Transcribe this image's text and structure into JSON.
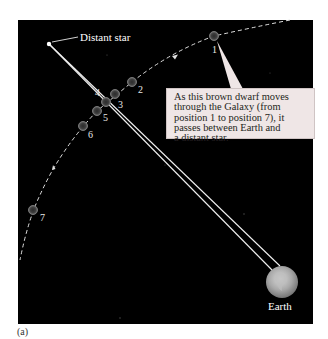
{
  "figure": {
    "panel_label": "(a)",
    "background_color": "#000000",
    "distant_star": {
      "label": "Distant star",
      "x": 49,
      "y": 44
    },
    "earth": {
      "label": "Earth",
      "x": 282,
      "y": 282,
      "radius": 16
    },
    "brown_dwarf_positions": [
      {
        "label": "1",
        "x": 214,
        "y": 36
      },
      {
        "label": "2",
        "x": 132,
        "y": 82
      },
      {
        "label": "3",
        "x": 115,
        "y": 94
      },
      {
        "label": "4",
        "x": 106,
        "y": 102
      },
      {
        "label": "5",
        "x": 97,
        "y": 111
      },
      {
        "label": "6",
        "x": 83,
        "y": 126
      },
      {
        "label": "7",
        "x": 33,
        "y": 210
      }
    ],
    "callout": {
      "lines": [
        "As this brown dwarf moves",
        "through the Galaxy (from",
        "position 1 to position 7), it",
        "passes between Earth and",
        "a distant star."
      ],
      "background_color": "#efe6e6"
    }
  }
}
